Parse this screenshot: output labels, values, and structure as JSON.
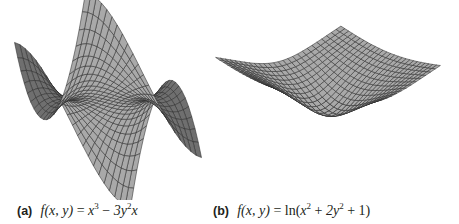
{
  "figures": [
    {
      "id": "a",
      "label": "(a)",
      "formula_text": "f(x, y) = x³ − 3y²x",
      "formula_parts": {
        "lhs": "f(x, y)",
        "eq": " = ",
        "t1": "x",
        "t1_exp": "3",
        "op": " − ",
        "t2": "3y",
        "t2_exp": "2",
        "t2_tail": "x"
      },
      "description": "Monkey saddle surface, gray mesh"
    },
    {
      "id": "b",
      "label": "(b)",
      "formula_text": "f(x, y) = ln(x² + 2y² + 1)",
      "formula_parts": {
        "lhs": "f(x, y)",
        "eq": " = ",
        "pre": "ln(",
        "t1": "x",
        "t1_exp": "2",
        "op1": " + ",
        "t2": "2y",
        "t2_exp": "2",
        "op2": " + ",
        "t3": "1",
        "post": ")"
      },
      "description": "Bowl-like logarithmic surface, gray mesh"
    }
  ],
  "style": {
    "surface_fill": "#a9a9a9",
    "surface_fill_dark": "#6f6f6f",
    "mesh_line": "#2e2e2e",
    "caption_color": "#231f20"
  }
}
